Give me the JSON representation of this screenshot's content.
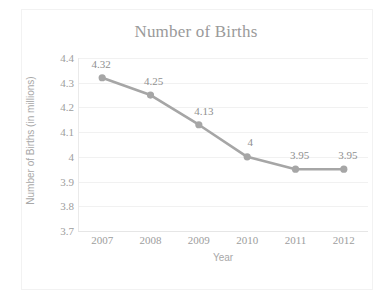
{
  "chart_data": {
    "type": "line",
    "title": "Number of Births",
    "xlabel": "Year",
    "ylabel": "Number of Births (in millions)",
    "categories": [
      "2007",
      "2008",
      "2009",
      "2010",
      "2011",
      "2012"
    ],
    "values": [
      4.32,
      4.25,
      4.13,
      4,
      3.95,
      3.95
    ],
    "point_labels": [
      "4.32",
      "4.25",
      "4.13",
      "4",
      "3.95",
      "3.95"
    ],
    "ylim": [
      3.7,
      4.4
    ],
    "yticks": [
      "4.4",
      "4.3",
      "4.2",
      "4.1",
      "4",
      "3.9",
      "3.8",
      "3.7"
    ],
    "ytick_values": [
      4.4,
      4.3,
      4.2,
      4.1,
      4.0,
      3.9,
      3.8,
      3.7
    ],
    "grid": "horizontal",
    "legend": "none",
    "series_color": "#a6a6a6",
    "marker": "circle",
    "text_color": "#9a9a9a"
  },
  "axis": {
    "x_title": "Year",
    "y_title": "Number of Births (in millions)"
  },
  "title": "Number of Births"
}
